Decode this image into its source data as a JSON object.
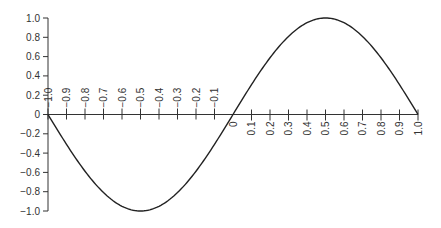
{
  "chart_data": {
    "type": "line",
    "title": "",
    "xlabel": "",
    "ylabel": "",
    "function": "y = sin(pi * x)",
    "xlim": [
      -1.0,
      1.0
    ],
    "ylim": [
      -1.0,
      1.0
    ],
    "grid": false,
    "legend": null,
    "x_ticks": [
      -1.0,
      -0.9,
      -0.8,
      -0.7,
      -0.6,
      -0.5,
      -0.4,
      -0.3,
      -0.2,
      -0.1,
      0,
      0.1,
      0.2,
      0.3,
      0.4,
      0.5,
      0.6,
      0.7,
      0.8,
      0.9,
      1.0
    ],
    "x_tick_labels": [
      "-1.0",
      "-0.9",
      "-0.8",
      "-0.7",
      "-0.6",
      "-0.5",
      "-0.4",
      "-0.3",
      "-0.2",
      "-0.1",
      "0",
      "0.1",
      "0.2",
      "0.3",
      "0.4",
      "0.5",
      "0.6",
      "0.7",
      "0.8",
      "0.9",
      "1.0"
    ],
    "y_ticks": [
      1.0,
      0.8,
      0.6,
      0.4,
      0.2,
      0,
      -0.2,
      -0.4,
      -0.6,
      -0.8,
      -1.0
    ],
    "y_tick_labels": [
      "1.0",
      "0.8",
      "0.6",
      "0.4",
      "0.2",
      "0",
      "−0.2",
      "−0.4",
      "−0.6",
      "−0.8",
      "−1.0"
    ],
    "series": [
      {
        "name": "sin(pi x)",
        "color": "#222222",
        "x": [
          -1.0,
          -0.9,
          -0.8,
          -0.7,
          -0.6,
          -0.5,
          -0.4,
          -0.3,
          -0.2,
          -0.1,
          0,
          0.1,
          0.2,
          0.3,
          0.4,
          0.5,
          0.6,
          0.7,
          0.8,
          0.9,
          1.0
        ],
        "y": [
          0,
          -0.309,
          -0.588,
          -0.809,
          -0.951,
          -1.0,
          -0.951,
          -0.809,
          -0.588,
          -0.309,
          0,
          0.309,
          0.588,
          0.809,
          0.951,
          1.0,
          0.951,
          0.809,
          0.588,
          0.309,
          0
        ]
      }
    ]
  },
  "colors": {
    "axis": "#333333",
    "text": "#333333",
    "line": "#222222",
    "background": "#ffffff"
  }
}
